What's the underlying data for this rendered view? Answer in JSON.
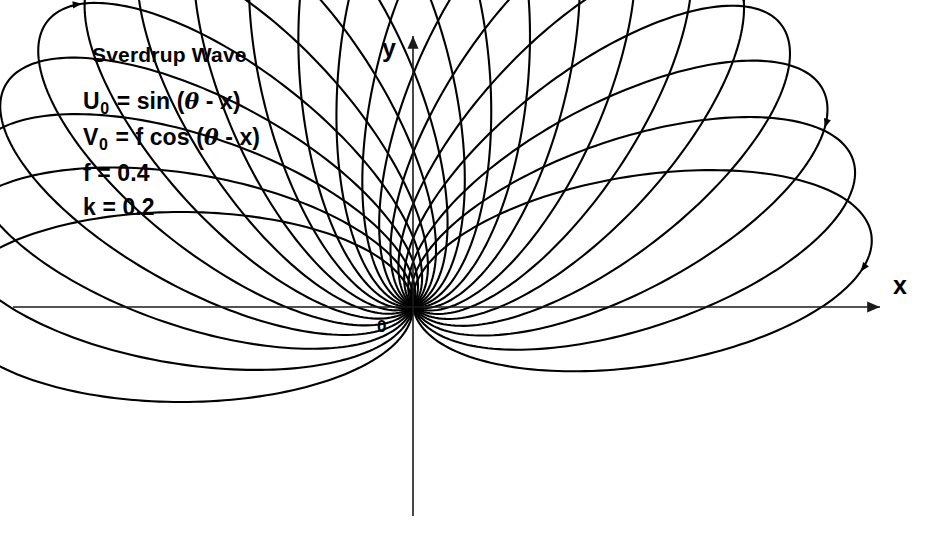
{
  "figure": {
    "title": "Sverdrup Wave",
    "equations": {
      "u_symbol": "U",
      "u_subscript": "0",
      "u_rhs_pre": " = sin (",
      "u_theta": "θ",
      "u_rhs_post": " - x)",
      "v_symbol": "V",
      "v_subscript": "0",
      "v_rhs_pre": " = f cos (",
      "v_theta": "θ",
      "v_rhs_post": " - x)",
      "f_line": "f = 0.4",
      "k_line": "k = 0.2"
    },
    "axes": {
      "x_label": "x",
      "y_label": "y",
      "origin_label": "0"
    },
    "colors": {
      "curve": "#000000",
      "axis": "#1a1a1a",
      "background": "#ffffff",
      "text": "#000000"
    }
  },
  "chart_data": {
    "type": "line",
    "title": "Sverdrup Wave",
    "xlabel": "x",
    "ylabel": "y",
    "grid": false,
    "legend": null,
    "parameters": {
      "f": 0.4,
      "k": 0.2,
      "u0_formula": "sin(theta - x)",
      "v0_formula": "f cos(theta - x)"
    },
    "axis_ranges": {
      "x_pixels": [
        13,
        886
      ],
      "y_pixels": [
        32,
        516
      ],
      "origin_pixels": [
        413,
        307
      ]
    },
    "ellipse_family": {
      "count": 19,
      "semi_major_px": 232,
      "semi_minor_px": 95,
      "rotation_start_deg": 0,
      "rotation_step_deg": 9.5,
      "common_node_px": [
        413,
        307
      ],
      "arrow_sense": "clockwise"
    },
    "series": [
      {
        "name": "ellipse-1",
        "rotation_deg": 0.0,
        "a": 232,
        "b": 95
      },
      {
        "name": "ellipse-2",
        "rotation_deg": 9.5,
        "a": 232,
        "b": 95
      },
      {
        "name": "ellipse-3",
        "rotation_deg": 19.0,
        "a": 232,
        "b": 95
      },
      {
        "name": "ellipse-4",
        "rotation_deg": 28.5,
        "a": 232,
        "b": 95
      },
      {
        "name": "ellipse-5",
        "rotation_deg": 38.0,
        "a": 232,
        "b": 95
      },
      {
        "name": "ellipse-6",
        "rotation_deg": 47.5,
        "a": 232,
        "b": 95
      },
      {
        "name": "ellipse-7",
        "rotation_deg": 57.0,
        "a": 232,
        "b": 95
      },
      {
        "name": "ellipse-8",
        "rotation_deg": 66.5,
        "a": 232,
        "b": 95
      },
      {
        "name": "ellipse-9",
        "rotation_deg": 76.0,
        "a": 232,
        "b": 95
      },
      {
        "name": "ellipse-10",
        "rotation_deg": 85.5,
        "a": 232,
        "b": 95
      },
      {
        "name": "ellipse-11",
        "rotation_deg": 95.0,
        "a": 232,
        "b": 95
      },
      {
        "name": "ellipse-12",
        "rotation_deg": 104.5,
        "a": 232,
        "b": 95
      },
      {
        "name": "ellipse-13",
        "rotation_deg": 114.0,
        "a": 232,
        "b": 95
      },
      {
        "name": "ellipse-14",
        "rotation_deg": 123.5,
        "a": 232,
        "b": 95
      },
      {
        "name": "ellipse-15",
        "rotation_deg": 133.0,
        "a": 232,
        "b": 95
      },
      {
        "name": "ellipse-16",
        "rotation_deg": 142.5,
        "a": 232,
        "b": 95
      },
      {
        "name": "ellipse-17",
        "rotation_deg": 152.0,
        "a": 232,
        "b": 95
      },
      {
        "name": "ellipse-18",
        "rotation_deg": 161.5,
        "a": 232,
        "b": 95
      },
      {
        "name": "ellipse-19",
        "rotation_deg": 171.0,
        "a": 232,
        "b": 95
      }
    ]
  }
}
